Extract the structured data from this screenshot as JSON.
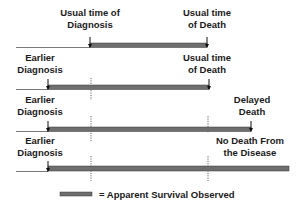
{
  "diagram": {
    "colors": {
      "bar": "#6e6e6e",
      "bar_edge": "#3a3a3a",
      "line": "#555555",
      "dotted": "#444444",
      "text": "#1a1a1a"
    },
    "rows": [
      {
        "id": "usual",
        "diagnosis_label": [
          "Usual time of",
          "Diagnosis"
        ],
        "end_label": [
          "Usual time",
          "of Death"
        ]
      },
      {
        "id": "earlier",
        "diagnosis_label": [
          "Earlier",
          "Diagnosis"
        ],
        "end_label": [
          "Usual time",
          "of Death"
        ]
      },
      {
        "id": "delayed",
        "diagnosis_label": [
          "Earlier",
          "Diagnosis"
        ],
        "end_label": [
          "Delayed",
          "Death"
        ]
      },
      {
        "id": "no-death",
        "diagnosis_label": [
          "Earlier",
          "Diagnosis"
        ],
        "end_label": [
          "No Death From",
          "the Disease"
        ]
      }
    ],
    "legend": {
      "text": "= Apparent Survival Observed"
    }
  }
}
